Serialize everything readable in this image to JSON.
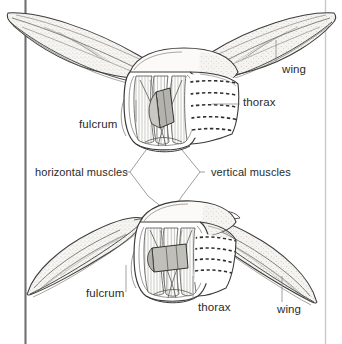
{
  "figure": {
    "background_color": "#ffffff",
    "ink_color": "#2b2b2b",
    "line_color": "#555555",
    "leader_color": "#6b6b6b",
    "wing_fill": "#f2f1ee",
    "fulcrum_fill": "#b8b7b2",
    "rule_color": "#707070"
  },
  "panels": {
    "upper": {
      "name": "upstroke-figure",
      "caption": "wings raised (up-stroke)",
      "labels": {
        "wing": "wing",
        "thorax": "thorax",
        "fulcrum": "fulcrum"
      }
    },
    "middle": {
      "labels": {
        "horizontal_muscles": "horizontal muscles",
        "vertical_muscles": "vertical muscles"
      }
    },
    "lower": {
      "name": "downstroke-figure",
      "caption": "wings lowered (down-stroke)",
      "labels": {
        "fulcrum": "fulcrum",
        "thorax": "thorax",
        "wing": "wing"
      }
    }
  },
  "icons": {
    "left_rule": "vertical-rule-icon",
    "right_rule": "vertical-rule-icon"
  }
}
